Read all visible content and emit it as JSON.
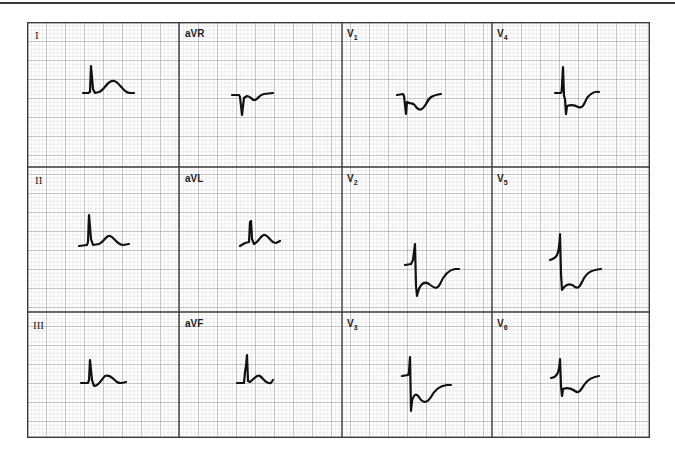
{
  "figure": {
    "layout": {
      "rows": 3,
      "columns": 4
    },
    "colors": {
      "grid_minor": "#c9c9c9",
      "grid_major": "#8a8a8a",
      "panel_border": "#3a3a3a",
      "trace": "#111111"
    },
    "leads": [
      {
        "id": "I",
        "label": "I",
        "sub": "",
        "row": 0,
        "col": 0
      },
      {
        "id": "aVR",
        "label": "aVR",
        "sub": "",
        "row": 0,
        "col": 1
      },
      {
        "id": "V1",
        "label": "V",
        "sub": "1",
        "row": 0,
        "col": 2
      },
      {
        "id": "V4",
        "label": "V",
        "sub": "4",
        "row": 0,
        "col": 3
      },
      {
        "id": "II",
        "label": "II",
        "sub": "",
        "row": 1,
        "col": 0
      },
      {
        "id": "aVL",
        "label": "aVL",
        "sub": "",
        "row": 1,
        "col": 1
      },
      {
        "id": "V2",
        "label": "V",
        "sub": "2",
        "row": 1,
        "col": 2
      },
      {
        "id": "V5",
        "label": "V",
        "sub": "5",
        "row": 1,
        "col": 3
      },
      {
        "id": "III",
        "label": "III",
        "sub": "",
        "row": 2,
        "col": 0
      },
      {
        "id": "aVF",
        "label": "aVF",
        "sub": "",
        "row": 2,
        "col": 1
      },
      {
        "id": "V3",
        "label": "V",
        "sub": "3",
        "row": 2,
        "col": 2
      },
      {
        "id": "V6",
        "label": "V",
        "sub": "6",
        "row": 2,
        "col": 3
      }
    ]
  }
}
